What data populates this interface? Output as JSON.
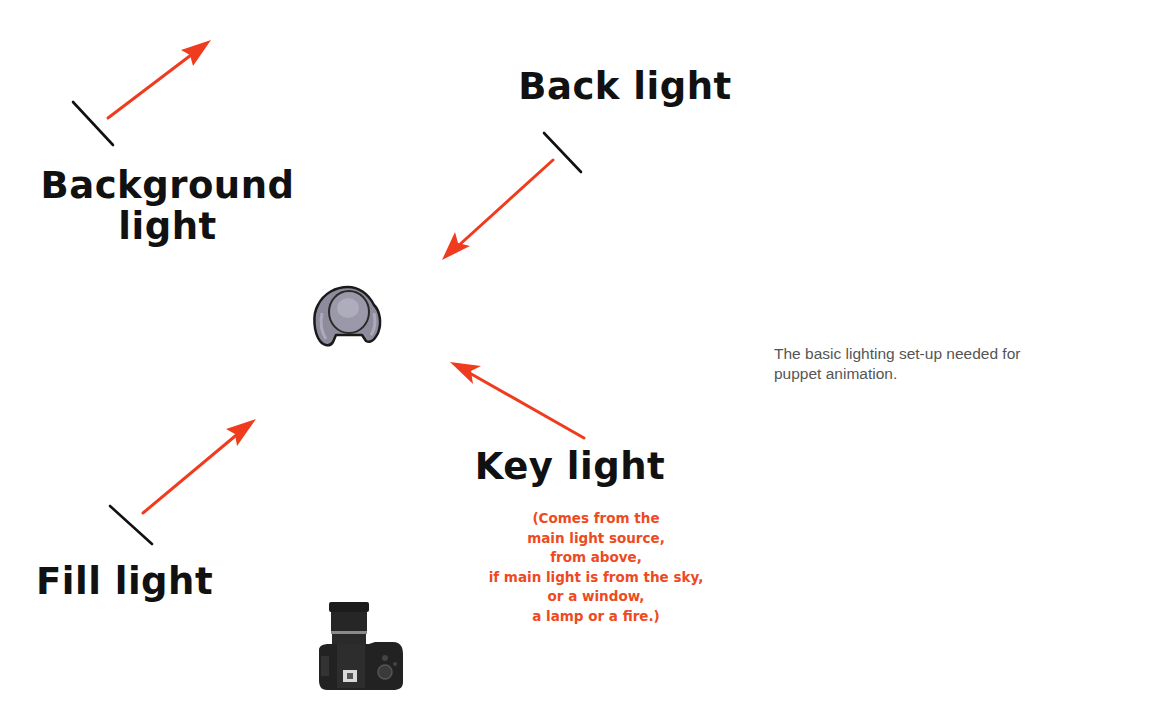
{
  "diagram": {
    "colors": {
      "arrow": "#f03c1e",
      "stand_line": "#111111",
      "label_text": "#111111",
      "note_text": "#ee4a22",
      "caption_text": "#555555",
      "background": "#ffffff",
      "puppet_fill": "#8e8c9c"
    },
    "lights": [
      {
        "id": "background",
        "label_lines": [
          "Background",
          "light"
        ],
        "stand": [
          73,
          102,
          113,
          145
        ],
        "arrow": [
          108,
          118,
          211,
          40
        ]
      },
      {
        "id": "back",
        "label_lines": [
          "Back light"
        ],
        "stand": [
          544,
          133,
          581,
          172
        ],
        "arrow": [
          553,
          160,
          442,
          260
        ]
      },
      {
        "id": "key",
        "label_lines": [
          "Key light"
        ],
        "arrow": [
          584,
          438,
          450,
          362
        ]
      },
      {
        "id": "fill",
        "label_lines": [
          "Fill light"
        ],
        "stand": [
          110,
          506,
          152,
          544
        ],
        "arrow": [
          143,
          513,
          256,
          419
        ]
      }
    ],
    "labels": {
      "background_light_line1": "Background",
      "background_light_line2": "light",
      "back_light": "Back light",
      "key_light": "Key light",
      "fill_light": "Fill light"
    },
    "key_light_note": {
      "lines": [
        "(Comes from the",
        "main light source,",
        "from above,",
        "if main light is from the sky,",
        "or a window,",
        "a lamp or a fire.)"
      ]
    },
    "subject": {
      "name": "puppet",
      "icon": "puppet-icon"
    },
    "camera": {
      "name": "camera",
      "icon": "camera-icon"
    }
  },
  "caption": {
    "lines": [
      "The basic lighting set-up needed for",
      "puppet animation."
    ]
  }
}
